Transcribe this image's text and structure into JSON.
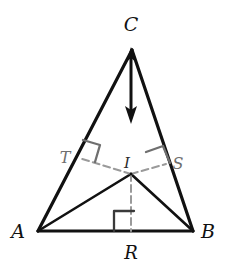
{
  "figure": {
    "background_color": "#ffffff",
    "stroke_color": "#111111",
    "gray_color": "#8c8c8c",
    "label_color": "#111111"
  },
  "vertices": {
    "A": {
      "label": "A",
      "x": 38,
      "y": 231,
      "label_x": 18,
      "label_y": 234
    },
    "B": {
      "label": "B",
      "x": 193,
      "y": 231,
      "label_x": 200,
      "label_y": 234
    },
    "C": {
      "label": "C",
      "x": 132,
      "y": 48,
      "label_x": 124,
      "label_y": 26
    }
  },
  "points": {
    "I": {
      "label": "I",
      "x": 131,
      "y": 174,
      "label_x": 124,
      "label_y": 166
    },
    "T": {
      "label": "T",
      "x": 79,
      "y": 158,
      "label_x": 58,
      "label_y": 159
    },
    "S": {
      "label": "S",
      "x": 166,
      "y": 164,
      "label_x": 171,
      "label_y": 166
    },
    "R": {
      "label": "R",
      "x": 131,
      "y": 231,
      "label_x": 124,
      "label_y": 258
    }
  },
  "segments": {
    "triangle_sides": [
      "AB",
      "BC",
      "CA"
    ],
    "cevians": [
      "AI",
      "BI"
    ],
    "inradii": [
      "IT",
      "IS",
      "IR"
    ]
  },
  "right_angle_marks": [
    {
      "at": "T",
      "on_side": "CA"
    },
    {
      "at": "S",
      "on_side": "CB"
    },
    {
      "at": "R",
      "on_side": "AB"
    }
  ],
  "arrow": {
    "name": "double-headed-vertical-arrow",
    "from_x": 131,
    "from_y": 52,
    "to_x": 131,
    "to_y": 122,
    "heads": "both"
  }
}
